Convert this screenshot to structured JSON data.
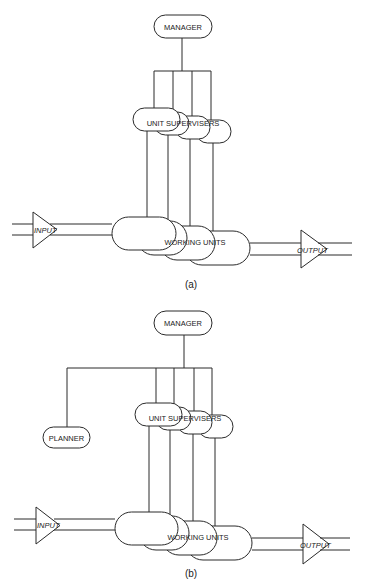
{
  "diagrams": [
    {
      "id": "a",
      "caption": "(a)",
      "manager": "MANAGER",
      "supervisors": "UNIT SUPERVISERS",
      "working_units": "WORKING UNITS",
      "input": "INPUT",
      "output": "OUTPUT"
    },
    {
      "id": "b",
      "caption": "(b)",
      "manager": "MANAGER",
      "planner": "PLANNER",
      "supervisors": "UNIT SUPERVISERS",
      "working_units": "WORKING UNITS",
      "input": "INPUT",
      "output": "OUTPUT"
    }
  ],
  "colors": {
    "stroke": "#2a2a2a",
    "background": "#ffffff"
  }
}
